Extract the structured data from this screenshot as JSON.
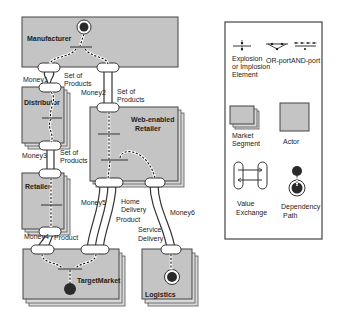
{
  "actors": {
    "manufacturer": "Manufacturer",
    "distributor": "Distributor",
    "retailer": "Retailer",
    "web_retailer_line1": "Web-enabled",
    "web_retailer_line2": "Retailer",
    "target_market": "TargetMarket",
    "logistics": "Logistics"
  },
  "exchanges": {
    "money1": "Money1",
    "money2": "Money2",
    "money3": "Money3",
    "money4": "Money4",
    "money5": "Money5",
    "money6": "Money6",
    "set_of": "Set of",
    "products": "Products",
    "product": "Product",
    "home": "Home",
    "delivery": "Delivery",
    "service": "Service"
  },
  "legend": {
    "explosion_line1": "Explosion",
    "explosion_line2": "or Implosion",
    "explosion_line3": "Element",
    "or_port": "OR-port",
    "and_port": "AND-port",
    "market_segment_line1": "Market",
    "market_segment_line2": "Segment",
    "actor": "Actor",
    "value_exchange_line1": "Value",
    "value_exchange_line2": "Exchange",
    "dependency_path_line1": "Dependency",
    "dependency_path_line2": "Path"
  },
  "colors": {
    "actor_fill": "#c4c4c4",
    "stroke": "#444444",
    "stimulus": "#2a2a2a"
  }
}
